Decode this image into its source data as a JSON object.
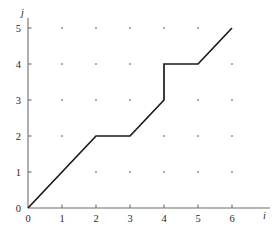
{
  "figure": {
    "background_color": "#ffffff",
    "line_color": "#1b1b1b",
    "axis_color": "#6e6e6e",
    "dot_color": "#8a8a8a"
  },
  "chart_data": {
    "type": "line",
    "title": "",
    "subtitle": "",
    "xlabel": "i",
    "ylabel": "j",
    "xlim": [
      0,
      6
    ],
    "ylim": [
      0,
      5
    ],
    "xticks": [
      0,
      1,
      2,
      3,
      4,
      5,
      6
    ],
    "yticks": [
      0,
      1,
      2,
      3,
      4,
      5
    ],
    "xtick_labels": [
      "0",
      "1",
      "2",
      "3",
      "4",
      "5",
      "6"
    ],
    "ytick_labels": [
      "0",
      "1",
      "2",
      "3",
      "4",
      "5"
    ],
    "grid": "dots-at-integer-lattice",
    "legend": "none",
    "annotations": [],
    "series": [
      {
        "name": "warping path",
        "x": [
          0,
          2,
          3,
          4,
          4,
          5,
          6
        ],
        "y": [
          0,
          2,
          2,
          3,
          4,
          4,
          5
        ],
        "points": [
          [
            0,
            0
          ],
          [
            2,
            2
          ],
          [
            3,
            2
          ],
          [
            4,
            3
          ],
          [
            4,
            4
          ],
          [
            5,
            4
          ],
          [
            6,
            5
          ]
        ],
        "style": "solid",
        "color": "#1b1b1b"
      }
    ],
    "lattice_points": [
      [
        1,
        1
      ],
      [
        2,
        1
      ],
      [
        3,
        1
      ],
      [
        4,
        1
      ],
      [
        5,
        1
      ],
      [
        6,
        1
      ],
      [
        1,
        2
      ],
      [
        2,
        2
      ],
      [
        3,
        2
      ],
      [
        4,
        2
      ],
      [
        5,
        2
      ],
      [
        6,
        2
      ],
      [
        1,
        3
      ],
      [
        2,
        3
      ],
      [
        3,
        3
      ],
      [
        4,
        3
      ],
      [
        5,
        3
      ],
      [
        6,
        3
      ],
      [
        1,
        4
      ],
      [
        2,
        4
      ],
      [
        3,
        4
      ],
      [
        4,
        4
      ],
      [
        5,
        4
      ],
      [
        6,
        4
      ],
      [
        1,
        5
      ],
      [
        2,
        5
      ],
      [
        3,
        5
      ],
      [
        4,
        5
      ],
      [
        5,
        5
      ],
      [
        6,
        5
      ]
    ]
  }
}
